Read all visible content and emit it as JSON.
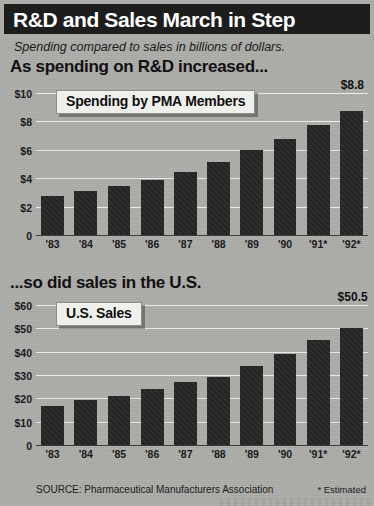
{
  "header": {
    "title": "R&D and Sales March in Step",
    "subtitle": "Spending compared to sales in billions of dollars."
  },
  "sections": {
    "top_title": "As spending on R&D increased...",
    "bottom_title": "...so did sales in the U.S."
  },
  "legends": {
    "top": "Spending by PMA Members",
    "bottom": "U.S. Sales"
  },
  "footer": {
    "source": "SOURCE: Pharmaceutical Manufacturers Association",
    "estimated_note": "* Estimated"
  },
  "chart_data": [
    {
      "type": "bar",
      "title": "Spending by PMA Members",
      "section_heading": "As spending on R&D increased...",
      "xlabel": "",
      "ylabel": "",
      "categories": [
        "'83",
        "'84",
        "'85",
        "'86",
        "'87",
        "'88",
        "'89",
        "'90",
        "'91*",
        "'92*"
      ],
      "values": [
        2.8,
        3.1,
        3.5,
        3.9,
        4.5,
        5.2,
        6.0,
        6.8,
        7.8,
        8.8
      ],
      "ylim": [
        0,
        10
      ],
      "yticks": [
        0,
        2,
        4,
        6,
        8,
        10
      ],
      "ytick_labels": [
        "0",
        "$2",
        "$4",
        "$6",
        "$8",
        "$10"
      ],
      "grid": true,
      "legend_position": "inside-top-left",
      "annotations": [
        {
          "category": "'92*",
          "text": "$8.8"
        }
      ],
      "bar_color": "#262626"
    },
    {
      "type": "bar",
      "title": "U.S. Sales",
      "section_heading": "...so did sales in the U.S.",
      "xlabel": "",
      "ylabel": "",
      "categories": [
        "'83",
        "'84",
        "'85",
        "'86",
        "'87",
        "'88",
        "'89",
        "'90",
        "'91*",
        "'92*"
      ],
      "values": [
        17.0,
        19.5,
        21.0,
        24.0,
        27.0,
        29.5,
        34.0,
        39.5,
        45.5,
        50.5
      ],
      "ylim": [
        0,
        60
      ],
      "yticks": [
        0,
        10,
        20,
        30,
        40,
        50,
        60
      ],
      "ytick_labels": [
        "0",
        "$10",
        "$20",
        "$30",
        "$40",
        "$50",
        "$60"
      ],
      "grid": true,
      "legend_position": "inside-top-left",
      "annotations": [
        {
          "category": "'92*",
          "text": "$50.5"
        }
      ],
      "bar_color": "#262626"
    }
  ],
  "colors": {
    "header_bg": "#1d1d1d",
    "header_text": "#ffffff",
    "page_bg": "#adadaa",
    "bar": "#262626",
    "gridline": "#e9e9e6",
    "callout_bg": "#efefec"
  }
}
